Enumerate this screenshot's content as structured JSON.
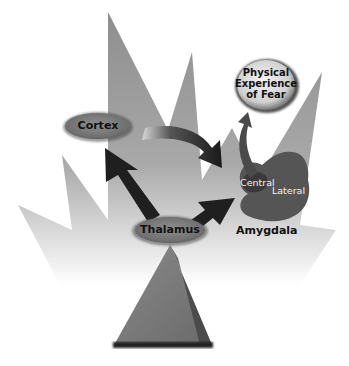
{
  "diagram": {
    "type": "fear-pathway",
    "nodes": {
      "cortex": {
        "label": "Cortex"
      },
      "thalamus": {
        "label": "Thalamus"
      },
      "fear": {
        "label_lines": [
          "Physical",
          "Experience",
          "of Fear"
        ]
      },
      "amygdala": {
        "label": "Amygdala",
        "regions": {
          "central": "Central",
          "lateral": "Lateral"
        }
      }
    },
    "edges": [
      {
        "from": "thalamus",
        "to": "cortex"
      },
      {
        "from": "cortex",
        "to": "amygdala"
      },
      {
        "from": "thalamus",
        "to": "amygdala"
      },
      {
        "from": "amygdala",
        "to": "fear"
      }
    ],
    "colors": {
      "background_shape": "#9a9a9a",
      "ellipse_fill": "#7d7d7d",
      "arrow": "#1e1e1e",
      "amygdala": "#5a5a5a"
    }
  }
}
